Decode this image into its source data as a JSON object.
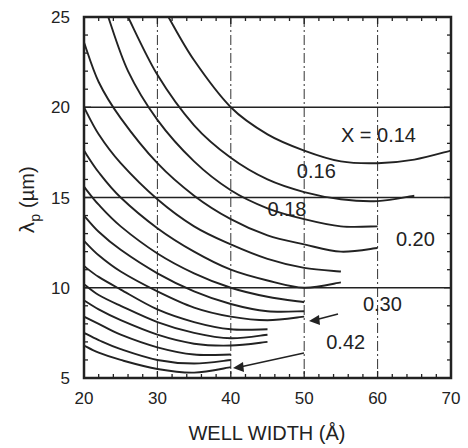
{
  "chart_data": {
    "type": "line",
    "title": "",
    "xlabel": "WELL WIDTH (Å)",
    "ylabel": "λp (µm)",
    "ylabel_main": "λ",
    "ylabel_sub": "p",
    "ylabel_unit": "(µm)",
    "xlim": [
      20,
      70
    ],
    "ylim": [
      5,
      25
    ],
    "xticks": [
      "20",
      "30",
      "40",
      "50",
      "60",
      "70"
    ],
    "yticks": [
      "5",
      "10",
      "15",
      "20",
      "25"
    ],
    "grid": {
      "x_dashed": [
        30,
        40,
        50,
        60
      ],
      "y_solid": [
        10,
        15,
        20
      ]
    },
    "legend": null,
    "annotations": [
      {
        "text": "X = 0.14",
        "x": 55,
        "y": 18.1
      },
      {
        "text": "0.16",
        "x": 49,
        "y": 16.1
      },
      {
        "text": "0.18",
        "x": 45,
        "y": 14.0
      },
      {
        "text": "0.20",
        "x": 62.5,
        "y": 12.3
      },
      {
        "text": "0.30",
        "x": 58,
        "y": 8.7
      },
      {
        "text": "0.42",
        "x": 53,
        "y": 6.6
      }
    ],
    "series": [
      {
        "name": "0.14",
        "x": [
          31.5,
          35,
          40,
          45,
          50,
          55,
          60,
          65,
          70
        ],
        "y": [
          25,
          22.6,
          20.0,
          18.5,
          17.6,
          17.0,
          16.9,
          17.1,
          17.6
        ]
      },
      {
        "name": "0.16",
        "x": [
          26,
          30,
          35,
          40,
          45,
          50,
          55,
          60,
          65
        ],
        "y": [
          25,
          21.8,
          19.0,
          17.2,
          16.0,
          15.3,
          14.9,
          14.8,
          15.1
        ]
      },
      {
        "name": "0.18",
        "x": [
          23.3,
          26,
          30,
          35,
          40,
          45,
          50,
          55,
          60
        ],
        "y": [
          25,
          22.0,
          19.3,
          17.0,
          15.4,
          14.4,
          13.8,
          13.4,
          13.4
        ]
      },
      {
        "name": "0.20",
        "x": [
          20,
          22,
          25,
          30,
          35,
          40,
          45,
          50,
          55,
          60
        ],
        "y": [
          23.6,
          21.4,
          19.4,
          16.9,
          15.1,
          13.8,
          12.9,
          12.4,
          12.0,
          12.2
        ]
      },
      {
        "name": "0.22",
        "x": [
          20,
          22,
          25,
          30,
          35,
          40,
          45,
          50,
          55
        ],
        "y": [
          20.0,
          18.5,
          16.9,
          14.9,
          13.4,
          12.4,
          11.6,
          11.1,
          10.9
        ]
      },
      {
        "name": "0.24",
        "x": [
          20,
          22,
          25,
          30,
          35,
          40,
          45,
          50,
          55
        ],
        "y": [
          17.6,
          16.4,
          15.0,
          13.3,
          12.0,
          11.0,
          10.4,
          10.0,
          10.3
        ]
      },
      {
        "name": "0.26",
        "x": [
          20,
          22,
          25,
          30,
          35,
          40,
          45,
          50
        ],
        "y": [
          15.6,
          14.6,
          13.4,
          11.9,
          10.8,
          10.0,
          9.5,
          9.2
        ]
      },
      {
        "name": "0.28",
        "x": [
          20,
          22,
          25,
          30,
          35,
          40,
          45,
          50
        ],
        "y": [
          14.0,
          13.1,
          12.1,
          10.8,
          9.8,
          9.1,
          8.7,
          8.7
        ]
      },
      {
        "name": "0.30",
        "x": [
          20,
          22,
          25,
          30,
          35,
          40,
          45,
          50
        ],
        "y": [
          12.6,
          11.8,
          10.9,
          9.8,
          8.9,
          8.4,
          8.2,
          8.4
        ]
      },
      {
        "name": "0.32",
        "x": [
          20,
          22,
          25,
          30,
          35,
          40,
          45
        ],
        "y": [
          11.2,
          10.6,
          9.9,
          8.8,
          8.1,
          7.7,
          7.7
        ]
      },
      {
        "name": "0.34",
        "x": [
          20,
          22,
          25,
          30,
          35,
          40,
          45
        ],
        "y": [
          10.2,
          9.6,
          9.0,
          8.1,
          7.5,
          7.2,
          7.4
        ]
      },
      {
        "name": "0.36",
        "x": [
          20,
          22,
          25,
          30,
          35,
          40,
          45
        ],
        "y": [
          9.3,
          8.8,
          8.2,
          7.4,
          6.9,
          6.8,
          7.0
        ]
      },
      {
        "name": "0.38",
        "x": [
          20,
          22,
          25,
          30,
          35,
          40
        ],
        "y": [
          8.4,
          8.0,
          7.4,
          6.7,
          6.3,
          6.3
        ]
      },
      {
        "name": "0.40",
        "x": [
          20,
          22,
          25,
          30,
          35,
          40
        ],
        "y": [
          7.5,
          7.1,
          6.6,
          6.0,
          5.8,
          6.0
        ]
      },
      {
        "name": "0.42",
        "x": [
          20,
          22,
          25,
          30,
          35,
          40
        ],
        "y": [
          6.8,
          6.4,
          6.0,
          5.5,
          5.3,
          5.6
        ]
      }
    ]
  }
}
